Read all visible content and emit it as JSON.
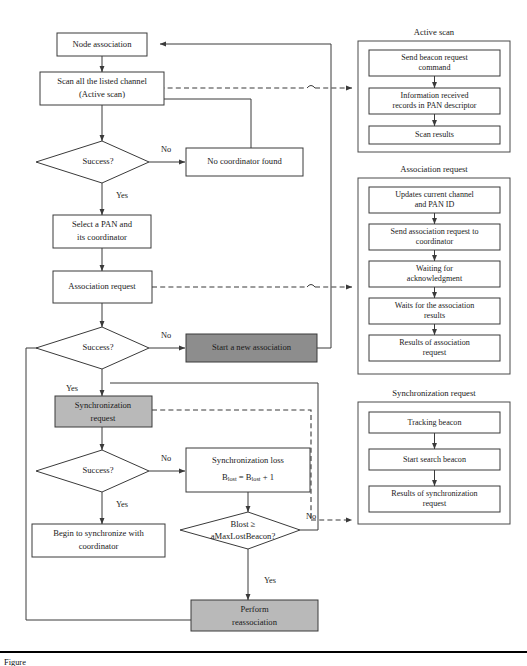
{
  "figure": {
    "caption_prefix": "Figure",
    "caption": ""
  },
  "colors": {
    "dark_fill": "#8d8d8d",
    "gray_fill": "#b9b9b9",
    "white_fill": "#ffffff",
    "stroke": "#3a3a3a"
  },
  "main_flow": {
    "nodes": {
      "node_association": "Node association",
      "scan_channel_l1": "Scan all the listed channel",
      "scan_channel_l2": "(Active scan)",
      "success_1": "Success?",
      "no_coordinator": "No coordinator found",
      "select_pan_l1": "Select a PAN and",
      "select_pan_l2": "its coordinator",
      "association_request": "Association request",
      "success_2": "Success?",
      "start_new_association": "Start a new association",
      "sync_request_l1": "Synchronization",
      "sync_request_l2": "request",
      "success_3": "Success?",
      "sync_loss_l1": "Synchronization loss",
      "sync_loss_l2_a": "B",
      "sync_loss_l2_sub1": "lost",
      "sync_loss_l2_b": " = B",
      "sync_loss_l2_sub2": "lost",
      "sync_loss_l2_c": " + 1",
      "begin_sync_l1": "Begin to synchronize with",
      "begin_sync_l2": "coordinator",
      "blost_check_l1": "Blost ≥",
      "blost_check_l2": "aMaxLostBeacon?",
      "perform_reassoc_l1": "Perform",
      "perform_reassoc_l2": "reassociation"
    },
    "edge_labels": {
      "success1_no": "No",
      "success1_yes": "Yes",
      "success2_no": "No",
      "success2_yes": "Yes",
      "success3_no": "No",
      "success3_yes": "Yes",
      "blost_no": "No",
      "blost_yes": "Yes"
    }
  },
  "panels": [
    {
      "id": "active-scan",
      "title": "Active scan",
      "steps": [
        {
          "l1": "Send beacon request",
          "l2": "command"
        },
        {
          "l1": "Information received",
          "l2": "records in PAN descriptor"
        },
        {
          "l1": "Scan results",
          "l2": ""
        }
      ]
    },
    {
      "id": "association-request",
      "title": "Association request",
      "steps": [
        {
          "l1": "Updates current channel",
          "l2": "and PAN ID"
        },
        {
          "l1": "Send association request to",
          "l2": "coordinator"
        },
        {
          "l1": "Waiting for",
          "l2": "acknowledgment"
        },
        {
          "l1": "Waits for the association",
          "l2": "results"
        },
        {
          "l1": "Results of association",
          "l2": "request"
        }
      ]
    },
    {
      "id": "synchronization-request",
      "title": "Synchronization request",
      "steps": [
        {
          "l1": "Tracking beacon",
          "l2": ""
        },
        {
          "l1": "Start search beacon",
          "l2": ""
        },
        {
          "l1": "Results of synchronization",
          "l2": "request"
        }
      ]
    }
  ]
}
